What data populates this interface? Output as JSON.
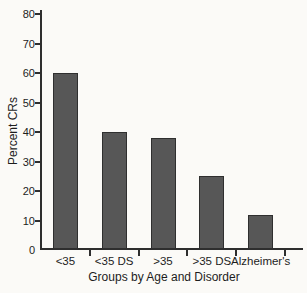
{
  "chart_data": {
    "type": "bar",
    "categories": [
      "<35",
      "<35 DS",
      ">35",
      ">35 DS",
      "Alzheimer's"
    ],
    "values": [
      60,
      40,
      38,
      25,
      12
    ],
    "title": "",
    "xlabel": "Groups by Age and Disorder",
    "ylabel": "Percent CRs",
    "ylim": [
      0,
      80
    ],
    "yticks": [
      0,
      10,
      20,
      30,
      40,
      50,
      60,
      70,
      80
    ],
    "grid": false,
    "legend_position": "none",
    "bar_color": "#575757",
    "bar_border_color": "#2f2f2f",
    "axis_color": "#2e2e2e",
    "text_color": "#1d1d1d",
    "background_color": "#fbfaf7"
  }
}
